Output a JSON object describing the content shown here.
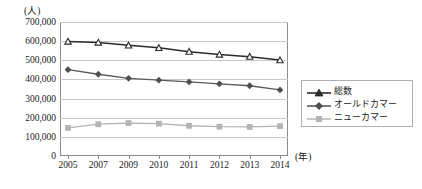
{
  "chart_data": {
    "type": "line",
    "title": "",
    "xlabel": "(年)",
    "ylabel": "(人)",
    "categories": [
      "2005",
      "2007",
      "2009",
      "2010",
      "2011",
      "2012",
      "2013",
      "2014"
    ],
    "ylim": [
      0,
      700000
    ],
    "ytick_labels": [
      "700,000",
      "600,000",
      "500,000",
      "400,000",
      "300,000",
      "200,000",
      "100,000",
      "0"
    ],
    "ytick_values": [
      700000,
      600000,
      500000,
      400000,
      300000,
      200000,
      100000,
      0
    ],
    "grid": true,
    "legend_position": "right",
    "series": [
      {
        "name": "総数",
        "marker": "triangle",
        "color": "#2b2b2b",
        "values": [
          598000,
          593000,
          578000,
          565000,
          545000,
          530000,
          519000,
          501000
        ]
      },
      {
        "name": "オールドカマー",
        "marker": "diamond",
        "color": "#5a5a5a",
        "values": [
          451000,
          427000,
          406000,
          396000,
          387000,
          377000,
          367000,
          345000
        ]
      },
      {
        "name": "ニューカマー",
        "marker": "square",
        "color": "#b4b4b4",
        "values": [
          147000,
          166000,
          172000,
          169000,
          158000,
          153000,
          152000,
          156000
        ]
      }
    ]
  },
  "legend": {
    "items": [
      {
        "label": "総数"
      },
      {
        "label": "オールドカマー"
      },
      {
        "label": "ニューカマー"
      }
    ]
  },
  "axis_units": {
    "y_unit": "(人)",
    "x_unit": "(年)"
  }
}
